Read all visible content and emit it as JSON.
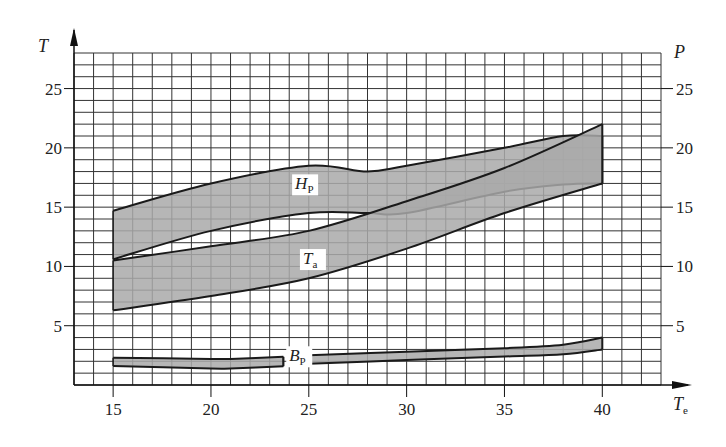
{
  "chart_data": {
    "type": "area",
    "title": "",
    "xlabel": "Te",
    "ylabel_left": "T",
    "ylabel_right": "P",
    "x_ticks": [
      15,
      20,
      25,
      30,
      35,
      40
    ],
    "y_ticks_left": [
      5,
      10,
      15,
      20,
      25
    ],
    "y_ticks_right": [
      5,
      10,
      15,
      20,
      25
    ],
    "xlim": [
      13,
      43
    ],
    "ylim": [
      0,
      28
    ],
    "grid": true,
    "grid_step": {
      "x": 1,
      "y": 1
    },
    "legend": "inline labels",
    "series": [
      {
        "name": "Hp",
        "label_main": "H",
        "label_sub": "P",
        "label_pos": [
          24.3,
          16.5
        ],
        "x": [
          15,
          20,
          25,
          28,
          30,
          35,
          38,
          40
        ],
        "upper": [
          14.7,
          17.0,
          18.5,
          18.0,
          18.5,
          20.0,
          21.0,
          21.0
        ],
        "lower": [
          10.6,
          13.0,
          14.5,
          14.5,
          14.5,
          16.3,
          16.9,
          17.0
        ]
      },
      {
        "name": "Ta",
        "label_main": "T",
        "label_sub": "a",
        "label_pos": [
          24.7,
          10.2
        ],
        "x": [
          15,
          20,
          25,
          30,
          35,
          40
        ],
        "upper": [
          10.5,
          11.7,
          13.0,
          15.5,
          18.3,
          22.0
        ],
        "lower": [
          6.3,
          7.5,
          9.0,
          11.5,
          14.5,
          17.0
        ]
      },
      {
        "name": "Bp",
        "label_main": "B",
        "label_sub": "P",
        "label_pos": [
          24.0,
          2.0
        ],
        "gap": [
          23.7,
          24.8
        ],
        "x": [
          15,
          20,
          21,
          24,
          25,
          30,
          35,
          38,
          40
        ],
        "upper": [
          2.3,
          2.2,
          2.2,
          2.4,
          2.5,
          2.8,
          3.1,
          3.4,
          4.0
        ],
        "lower": [
          1.6,
          1.4,
          1.4,
          1.6,
          1.8,
          2.1,
          2.4,
          2.6,
          3.0
        ]
      }
    ],
    "colors": {
      "band_fill": "#a9a9a9",
      "band_edge": "#1a1a1a",
      "grid": "#333333",
      "axis": "#111111"
    }
  }
}
